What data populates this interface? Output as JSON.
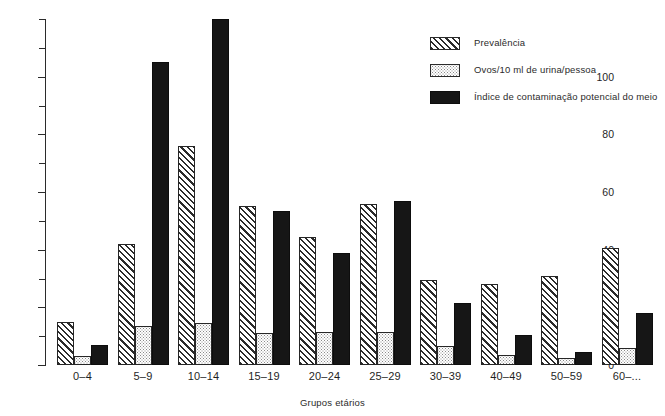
{
  "chart_data": {
    "type": "bar",
    "title": "",
    "subtitle": "",
    "xlabel": "Grupos etários",
    "ylabel": "",
    "ylim": [
      0,
      120
    ],
    "y_tick_step_major": 20,
    "y_tick_step_minor": 10,
    "grid": false,
    "legend_position": "top-right",
    "y_ticks_labeled": [
      "0",
      "20",
      "40",
      "60",
      "80",
      "100"
    ],
    "y_ticks_labeled_values": [
      0,
      20,
      40,
      60,
      80,
      100
    ],
    "y_ticks_all_values": [
      0,
      10,
      20,
      30,
      40,
      50,
      60,
      70,
      80,
      90,
      100,
      110,
      120
    ],
    "categories": [
      "0–4",
      "5–9",
      "10–14",
      "15–19",
      "20–24",
      "25–29",
      "30–39",
      "40–49",
      "50–59",
      "60–..."
    ],
    "series": [
      {
        "name": "Prevalência",
        "fill": "hatched",
        "color": "#2b2b2b",
        "values": [
          15,
          42,
          76,
          55,
          44.5,
          56,
          29.5,
          28,
          31,
          40.5
        ]
      },
      {
        "name": "Ovos/10 ml de urina/pessoa",
        "fill": "dotted",
        "color": "#8a8a8a",
        "values": [
          3,
          13.5,
          14.5,
          11,
          11.5,
          11.5,
          6.5,
          3.5,
          2.5,
          6
        ]
      },
      {
        "name": "Índice de contaminação potencial do meio",
        "fill": "solid",
        "color": "#161616",
        "values": [
          7,
          105,
          120,
          53.5,
          39,
          57,
          21.5,
          10.5,
          4.5,
          18
        ]
      }
    ]
  },
  "legend": {
    "items": [
      {
        "label": "Prevalência",
        "swatch": "hatched"
      },
      {
        "label": "Ovos/10 ml de urina/pessoa",
        "swatch": "dotted"
      },
      {
        "label": "Índice de contaminação potencial do meio",
        "swatch": "solid"
      }
    ]
  },
  "axes": {
    "x_title": "Grupos etários"
  }
}
